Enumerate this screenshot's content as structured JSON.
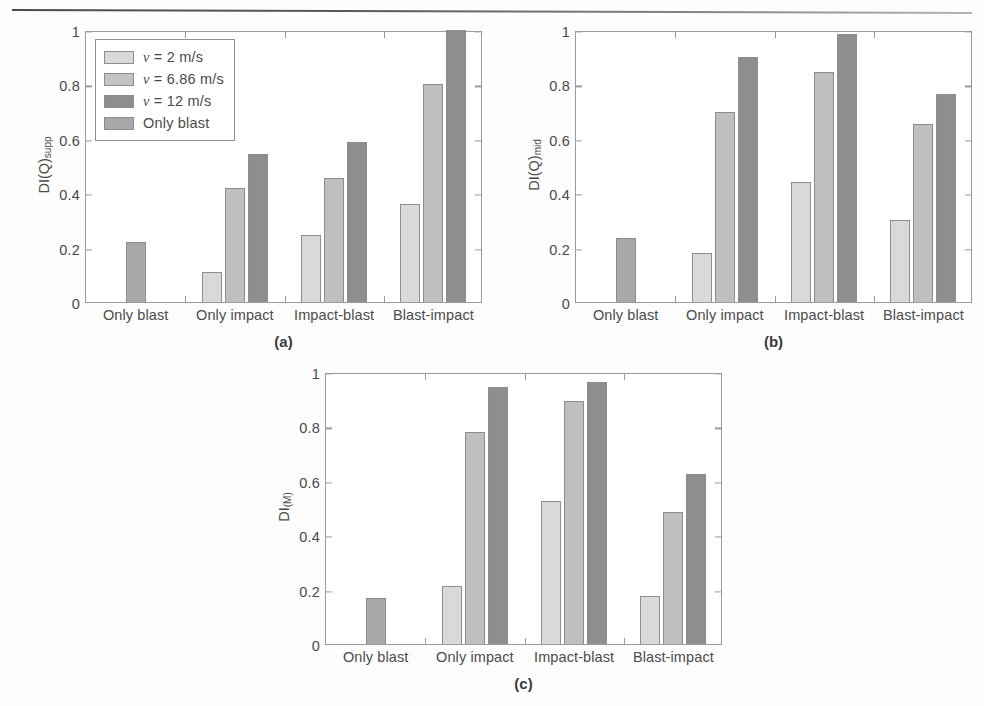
{
  "figure": {
    "categories": [
      "Only blast",
      "Only impact",
      "Impact-blast",
      "Blast-impact"
    ],
    "y_ticks": [
      "0",
      "0.2",
      "0.4",
      "0.6",
      "0.8",
      "1"
    ],
    "y_range": [
      0,
      1
    ],
    "series_names": [
      "v = 2 m/s",
      "v = 6.86 m/s",
      "v = 12 m/s",
      "Only blast"
    ],
    "colors": {
      "v2": "#d9d9d9",
      "v686": "#bfbfbf",
      "v12": "#8e8e8e",
      "only_blast": "#a9a9a9",
      "axis": "#9a9a9a",
      "text": "#4a4a4a"
    }
  },
  "legend": {
    "items": [
      {
        "label_pre": "v",
        "label_post": " = 2 m/s",
        "swatch": "#d9d9d9",
        "icon": "legend-swatch-v2"
      },
      {
        "label_pre": "v",
        "label_post": " = 6.86 m/s",
        "swatch": "#c4c4c4",
        "icon": "legend-swatch-v686"
      },
      {
        "label_pre": "v",
        "label_post": " = 12 m/s",
        "swatch": "#8e8e8e",
        "icon": "legend-swatch-v12"
      },
      {
        "label_pre": "",
        "label_post": "Only blast",
        "swatch": "#a9a9a9",
        "icon": "legend-swatch-only-blast"
      }
    ]
  },
  "chart_data": [
    {
      "id": "a",
      "type": "bar",
      "title": "",
      "caption": "(a)",
      "xlabel": "",
      "ylabel": "DI(Q)supp",
      "ylabel_main": "DI",
      "ylabel_paren": "(Q)",
      "ylabel_sub": "supp",
      "ylim": [
        0,
        1
      ],
      "yticks": [
        0,
        0.2,
        0.4,
        0.6,
        0.8,
        1
      ],
      "ytick_labels": [
        "0",
        "0.2",
        "0.4",
        "0.6",
        "0.8",
        "1"
      ],
      "grid": false,
      "legend_position": "upper-left",
      "categories": [
        "Only blast",
        "Only impact",
        "Impact-blast",
        "Blast-impact"
      ],
      "series": [
        {
          "name": "v = 2 m/s",
          "values": [
            null,
            0.11,
            0.245,
            0.36
          ]
        },
        {
          "name": "v = 6.86 m/s",
          "values": [
            null,
            0.42,
            0.455,
            0.8
          ]
        },
        {
          "name": "v = 12 m/s",
          "values": [
            null,
            0.545,
            0.59,
            1.0
          ]
        },
        {
          "name": "Only blast",
          "values": [
            0.22,
            null,
            null,
            null
          ]
        }
      ]
    },
    {
      "id": "b",
      "type": "bar",
      "title": "",
      "caption": "(b)",
      "xlabel": "",
      "ylabel": "DI(Q)mid",
      "ylabel_main": "DI",
      "ylabel_paren": "(Q)",
      "ylabel_sub": "mid",
      "ylim": [
        0,
        1
      ],
      "yticks": [
        0,
        0.2,
        0.4,
        0.6,
        0.8,
        1
      ],
      "ytick_labels": [
        "0",
        "0.2",
        "0.4",
        "0.6",
        "0.8",
        "1"
      ],
      "grid": false,
      "legend_position": "none",
      "categories": [
        "Only blast",
        "Only impact",
        "Impact-blast",
        "Blast-impact"
      ],
      "series": [
        {
          "name": "v = 2 m/s",
          "values": [
            null,
            0.18,
            0.44,
            0.3
          ]
        },
        {
          "name": "v = 6.86 m/s",
          "values": [
            null,
            0.7,
            0.845,
            0.655
          ]
        },
        {
          "name": "v = 12 m/s",
          "values": [
            null,
            0.9,
            0.985,
            0.765
          ]
        },
        {
          "name": "Only blast",
          "values": [
            0.235,
            null,
            null,
            null
          ]
        }
      ]
    },
    {
      "id": "c",
      "type": "bar",
      "title": "",
      "caption": "(c)",
      "xlabel": "",
      "ylabel": "DI(M)",
      "ylabel_main": "DI",
      "ylabel_paren": "",
      "ylabel_sub": "(M)",
      "ylim": [
        0,
        1
      ],
      "yticks": [
        0,
        0.2,
        0.4,
        0.6,
        0.8,
        1
      ],
      "ytick_labels": [
        "0",
        "0.2",
        "0.4",
        "0.6",
        "0.8",
        "1"
      ],
      "grid": false,
      "legend_position": "none",
      "categories": [
        "Only blast",
        "Only impact",
        "Impact-blast",
        "Blast-impact"
      ],
      "series": [
        {
          "name": "v = 2 m/s",
          "values": [
            null,
            0.215,
            0.525,
            0.175
          ]
        },
        {
          "name": "v = 6.86 m/s",
          "values": [
            null,
            0.78,
            0.895,
            0.485
          ]
        },
        {
          "name": "v = 12 m/s",
          "values": [
            null,
            0.945,
            0.965,
            0.625
          ]
        },
        {
          "name": "Only blast",
          "values": [
            0.17,
            null,
            null,
            null
          ]
        }
      ]
    }
  ]
}
